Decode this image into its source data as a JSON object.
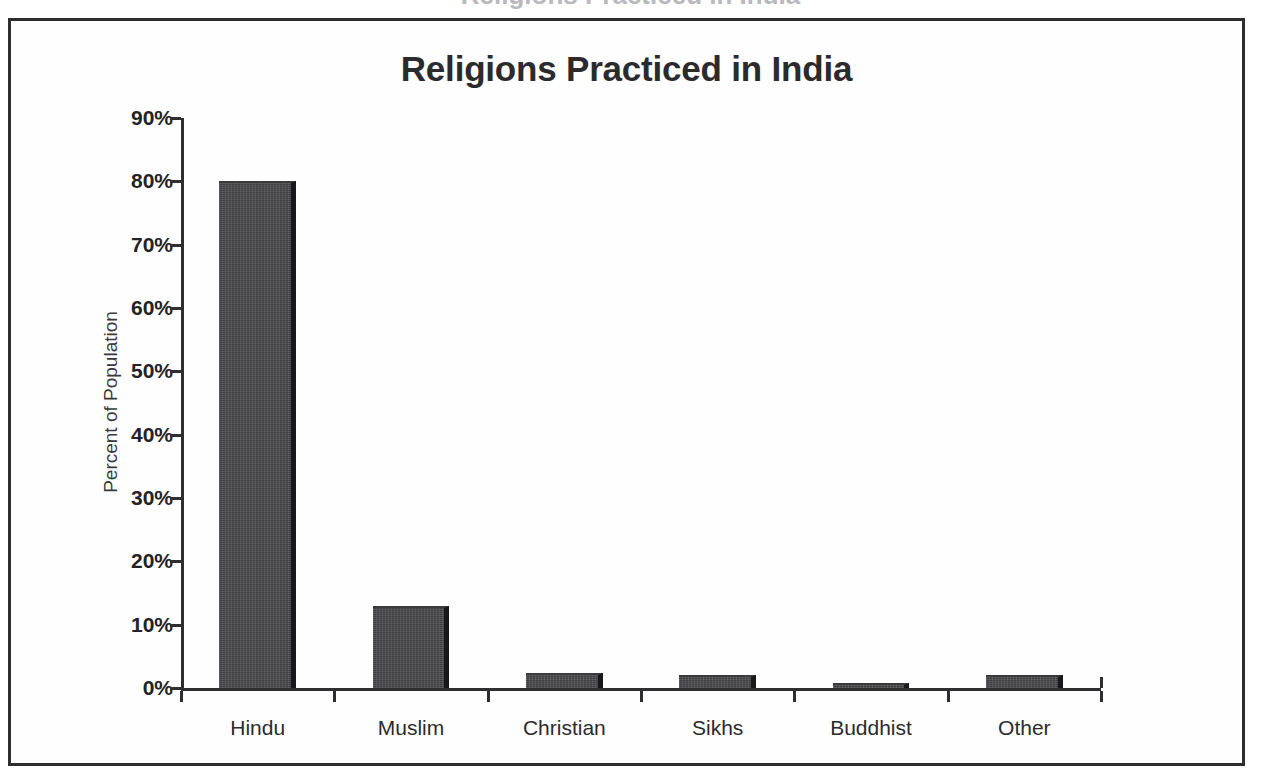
{
  "page": {
    "partial_heading_above": "Religions Practiced in India"
  },
  "frame": {
    "border_color": "#2e2e30"
  },
  "chart_data": {
    "type": "bar",
    "title": "Religions Practiced in India",
    "xlabel": "",
    "ylabel": "Percent of Population",
    "categories": [
      "Hindu",
      "Muslim",
      "Christian",
      "Sikhs",
      "Buddhist",
      "Other"
    ],
    "values": [
      80,
      13,
      2.3,
      2,
      0.8,
      2
    ],
    "value_labels": [
      "80%",
      "13%",
      "2.3%",
      "2%",
      "0.8%",
      "2%"
    ],
    "ylim": [
      0,
      90
    ],
    "ytick_values": [
      0,
      10,
      20,
      30,
      40,
      50,
      60,
      70,
      80,
      90
    ],
    "ytick_labels": [
      "0%",
      "10%",
      "20%",
      "30%",
      "40%",
      "50%",
      "60%",
      "70%",
      "80%",
      "90%"
    ],
    "grid": false,
    "legend": false,
    "legend_position": "none",
    "bar_color": "#474749",
    "bar_shadow_color": "#18181a",
    "axis_color": "#2e2e30",
    "background": "#fefefe"
  }
}
